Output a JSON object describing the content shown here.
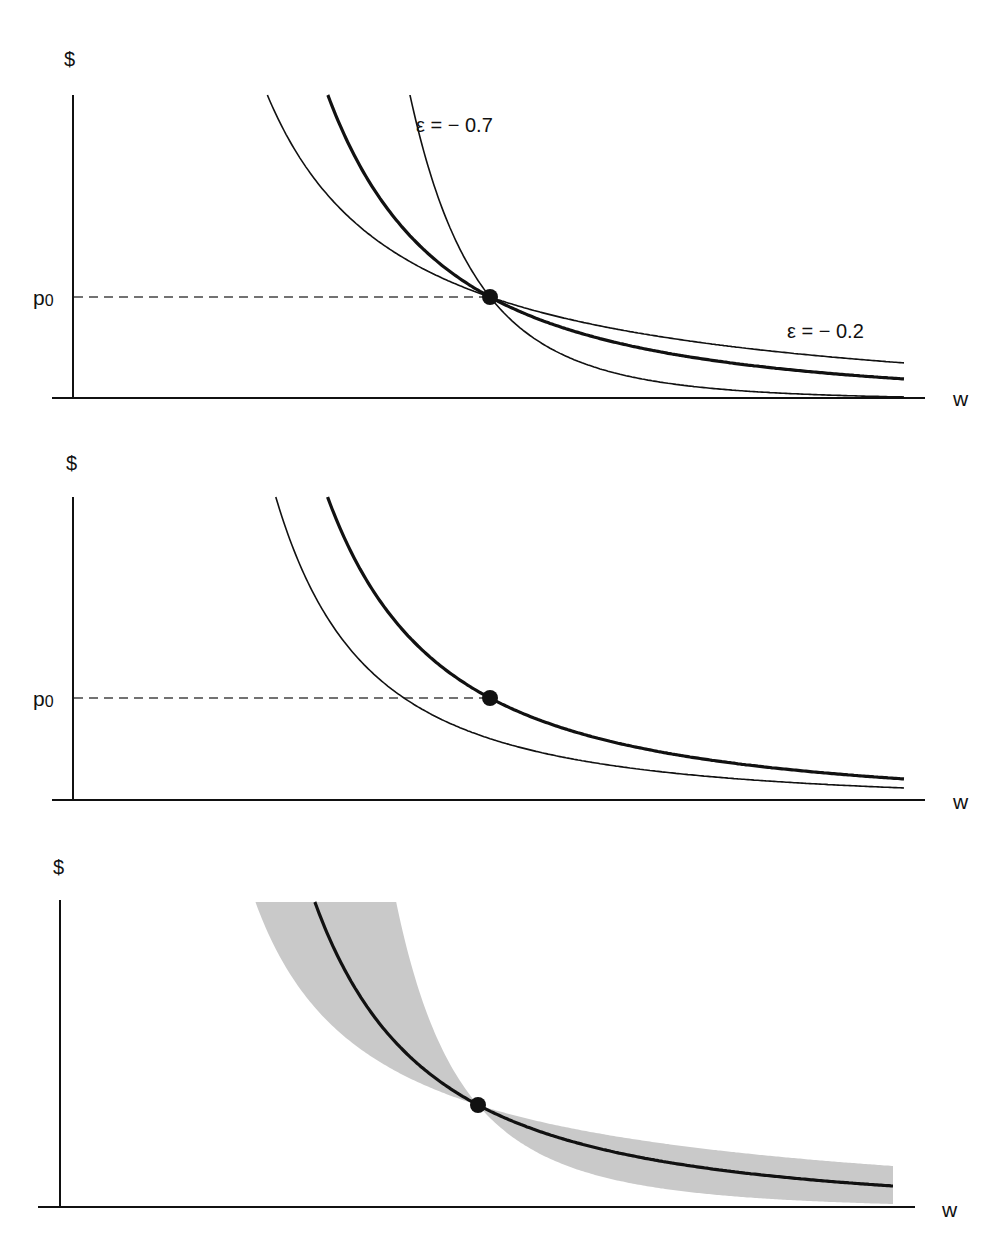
{
  "figure": {
    "panels": [
      {
        "id": "top",
        "y_axis_label": "$",
        "x_axis_label": "w",
        "price_label": "p",
        "price_label_sub": "0",
        "annotations": [
          {
            "text": "ε = − 0.7",
            "x": 416,
            "y": 132
          },
          {
            "text": "ε = − 0.2",
            "x": 787,
            "y": 338
          }
        ]
      },
      {
        "id": "middle",
        "y_axis_label": "$",
        "x_axis_label": "w",
        "price_label": "p",
        "price_label_sub": "0",
        "annotations": []
      },
      {
        "id": "bottom",
        "y_axis_label": "$",
        "x_axis_label": "w",
        "annotations": []
      }
    ]
  },
  "chart_data": [
    {
      "type": "line",
      "title": "",
      "xlabel": "w",
      "ylabel": "$",
      "reference_line": {
        "label": "p0",
        "style": "dashed"
      },
      "marked_point": {
        "label": "(w0, p0)"
      },
      "series": [
        {
          "name": "ε = −0.7",
          "style": "thin",
          "description": "steep demand curve through (w0,p0)"
        },
        {
          "name": "baseline",
          "style": "thick",
          "description": "central demand curve through (w0,p0)"
        },
        {
          "name": "ε = −0.2",
          "style": "thin",
          "description": "flat demand curve through (w0,p0)"
        }
      ],
      "grid": false,
      "legend": "inline annotations"
    },
    {
      "type": "line",
      "title": "",
      "xlabel": "w",
      "ylabel": "$",
      "reference_line": {
        "label": "p0",
        "style": "dashed"
      },
      "marked_point": {
        "label": "(w0, p0)"
      },
      "series": [
        {
          "name": "demand curve",
          "style": "thick",
          "description": "passes through (w0,p0)"
        },
        {
          "name": "shifted demand curve",
          "style": "thin",
          "description": "shifted left / down"
        }
      ],
      "grid": false
    },
    {
      "type": "area",
      "title": "",
      "xlabel": "w",
      "ylabel": "$",
      "marked_point": {
        "label": "(w0, p0)"
      },
      "series": [
        {
          "name": "demand curve",
          "style": "thick"
        },
        {
          "name": "uncertainty band",
          "style": "gray shaded",
          "description": "range of elasticities pinching at the marked point"
        }
      ],
      "grid": false
    }
  ],
  "style": {
    "ink": "#111111",
    "band": "#c9c9c9",
    "dash": "#444444"
  }
}
